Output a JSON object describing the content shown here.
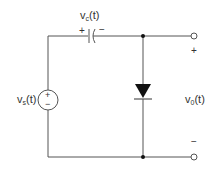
{
  "diagram": {
    "type": "circuit",
    "title": "",
    "components": [
      {
        "id": "source",
        "kind": "voltage-source",
        "label": "v",
        "subscript": "s",
        "suffix": "(t)",
        "plus": "+",
        "minus": "−"
      },
      {
        "id": "capacitor",
        "kind": "capacitor",
        "label": "v",
        "subscript": "c",
        "suffix": "(t)",
        "plus": "+",
        "minus": "−"
      },
      {
        "id": "diode",
        "kind": "diode",
        "orientation": "cathode-down"
      },
      {
        "id": "output",
        "kind": "output-terminals",
        "label": "v",
        "subscript": "0",
        "suffix": "(t)",
        "plus": "+",
        "minus": "−"
      }
    ],
    "colors": {
      "wire": "#555555",
      "fill": "#111111",
      "text": "#333333"
    }
  }
}
